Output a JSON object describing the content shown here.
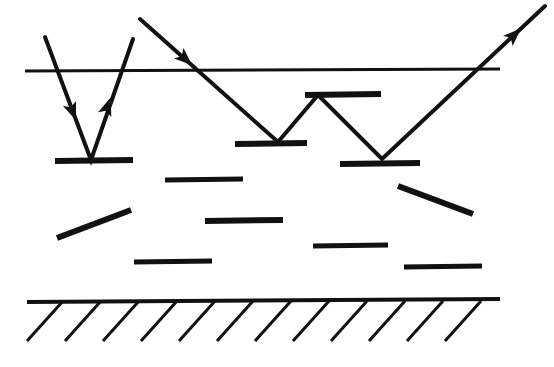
{
  "figure": {
    "kind": "ray-scattering-diagram",
    "width": 554,
    "height": 367,
    "background_color": "#ffffff",
    "ink_color": "#111111"
  },
  "boundaries": [
    {
      "name": "surface-line",
      "label": "upper surface",
      "x1": 25,
      "y1": 71,
      "x2": 500,
      "y2": 69,
      "thickness": 3
    },
    {
      "name": "ground-line",
      "label": "lower bed",
      "x1": 27,
      "y1": 302,
      "x2": 500,
      "y2": 299,
      "thickness": 4
    }
  ],
  "hatching": {
    "name": "ground-hatching",
    "count": 12,
    "start_x": 63,
    "spacing": 38,
    "dx": -36,
    "dy": 40,
    "thickness": 3,
    "baseline_y": 301
  },
  "platelets": [
    {
      "name": "platelet-left-bounce",
      "x1": 55,
      "y1": 161,
      "x2": 133,
      "y2": 160,
      "thickness": 6
    },
    {
      "name": "platelet-upper-mid",
      "x1": 165,
      "y1": 180,
      "x2": 243,
      "y2": 179,
      "thickness": 5
    },
    {
      "name": "platelet-mid-bounce-1",
      "x1": 235,
      "y1": 144,
      "x2": 307,
      "y2": 143,
      "thickness": 6
    },
    {
      "name": "platelet-apex-top",
      "x1": 305,
      "y1": 95,
      "x2": 381,
      "y2": 94,
      "thickness": 6
    },
    {
      "name": "platelet-mid-bounce-2",
      "x1": 340,
      "y1": 164,
      "x2": 420,
      "y2": 163,
      "thickness": 6
    },
    {
      "name": "platelet-tilted-left",
      "x1": 57,
      "y1": 238,
      "x2": 131,
      "y2": 210,
      "thickness": 6
    },
    {
      "name": "platelet-center",
      "x1": 205,
      "y1": 221,
      "x2": 283,
      "y2": 220,
      "thickness": 6
    },
    {
      "name": "platelet-lower-left",
      "x1": 134,
      "y1": 262,
      "x2": 212,
      "y2": 261,
      "thickness": 5
    },
    {
      "name": "platelet-tilted-right",
      "x1": 398,
      "y1": 186,
      "x2": 473,
      "y2": 214,
      "thickness": 6
    },
    {
      "name": "platelet-lower-right-a",
      "x1": 313,
      "y1": 246,
      "x2": 388,
      "y2": 245,
      "thickness": 5
    },
    {
      "name": "platelet-lower-right-b",
      "x1": 404,
      "y1": 267,
      "x2": 482,
      "y2": 266,
      "thickness": 5
    }
  ],
  "rays": [
    {
      "name": "ray-left-v",
      "label": "incident and reflected ray at left platelet",
      "points": "45,37 91,160 133,39",
      "thickness": 4,
      "arrows": [
        {
          "name": "arrowhead-down-left",
          "x": 72,
          "y": 110,
          "angle": 69
        },
        {
          "name": "arrowhead-up-left",
          "x": 107,
          "y": 108,
          "angle": -71
        }
      ]
    },
    {
      "name": "ray-zigzag",
      "label": "multiply scattered ray entering from upper left and exiting upper right",
      "points": "140,19 278,142 318,95 382,159 545,6",
      "thickness": 4,
      "arrows": [
        {
          "name": "arrowhead-entry",
          "x": 184,
          "y": 58,
          "angle": 42
        },
        {
          "name": "arrowhead-exit",
          "x": 513,
          "y": 36,
          "angle": -43
        }
      ]
    }
  ]
}
